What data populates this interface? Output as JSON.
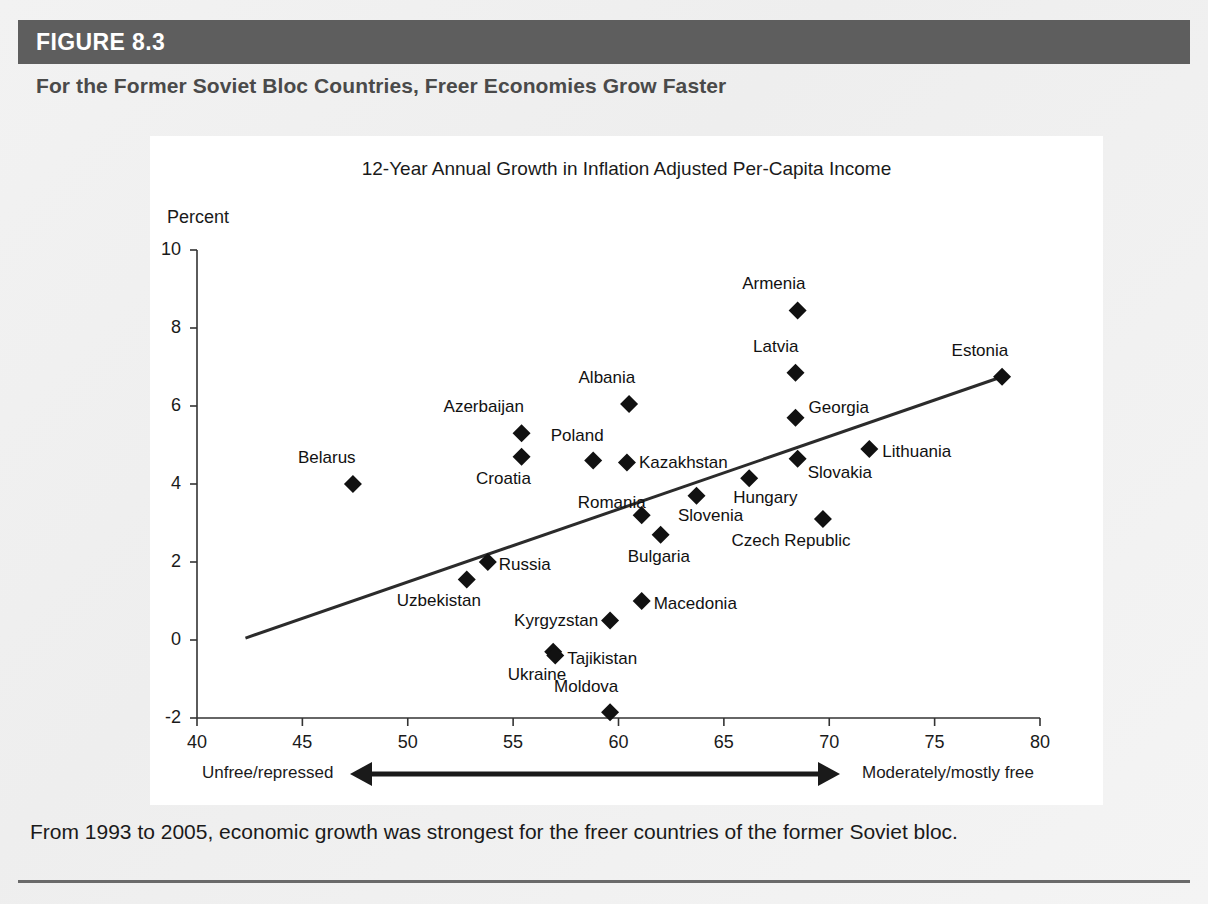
{
  "figure": {
    "number_label": "FIGURE 8.3",
    "title": "For the Former Soviet Bloc Countries, Freer Economies Grow Faster",
    "caption": "From 1993 to 2005, economic growth was strongest for the freer countries of the former Soviet bloc.",
    "bar_color": "#5e5e5e",
    "title_color": "#4a4a4a"
  },
  "chart_data": {
    "type": "scatter",
    "title": "12-Year Annual Growth in Inflation Adjusted Per-Capita Income",
    "xlabel": "",
    "ylabel": "Percent",
    "ylim": [
      -2,
      10
    ],
    "xlim": [
      40,
      80
    ],
    "xticks": [
      40,
      45,
      50,
      55,
      60,
      65,
      70,
      75,
      80
    ],
    "xtick_labels": [
      "40",
      "45",
      "50",
      "55",
      "60",
      "65",
      "70",
      "75",
      "80"
    ],
    "yticks": [
      -2,
      0,
      2,
      4,
      6,
      8,
      10
    ],
    "ytick_labels": [
      "-2",
      "0",
      "2",
      "4",
      "6",
      "8",
      "10"
    ],
    "grid": false,
    "legend": "none",
    "marker": "diamond",
    "marker_color": "#111111",
    "axis_direction": {
      "left_label": "Unfree/repressed",
      "right_label": "Moderately/mostly free",
      "arrow": "double"
    },
    "trendline": {
      "type": "linear",
      "x_start": 42.3,
      "y_start": 0.05,
      "x_end": 78.2,
      "y_end": 6.75,
      "color": "#2b2b2b"
    },
    "points": [
      {
        "name": "Armenia",
        "x": 68.5,
        "y": 8.45,
        "label_dx": -34,
        "label_dy": -26
      },
      {
        "name": "Latvia",
        "x": 68.4,
        "y": 6.85,
        "label_dx": -30,
        "label_dy": -26
      },
      {
        "name": "Estonia",
        "x": 78.2,
        "y": 6.75,
        "label_dx": -32,
        "label_dy": -26
      },
      {
        "name": "Albania",
        "x": 60.5,
        "y": 6.05,
        "label_dx": -32,
        "label_dy": -26
      },
      {
        "name": "Georgia",
        "x": 68.4,
        "y": 5.7,
        "label_dx": 13,
        "label_dy": -10
      },
      {
        "name": "Azerbaijan",
        "x": 55.4,
        "y": 5.3,
        "label_dx": -48,
        "label_dy": -26
      },
      {
        "name": "Lithuania",
        "x": 71.9,
        "y": 4.9,
        "label_dx": 13,
        "label_dy": 3
      },
      {
        "name": "Croatia",
        "x": 55.4,
        "y": 4.7,
        "label_dx": -36,
        "label_dy": 22
      },
      {
        "name": "Poland",
        "x": 58.8,
        "y": 4.6,
        "label_dx": -26,
        "label_dy": -25
      },
      {
        "name": "Slovakia",
        "x": 68.5,
        "y": 4.65,
        "label_dx": 10,
        "label_dy": 14
      },
      {
        "name": "Kazakhstan",
        "x": 60.4,
        "y": 4.55,
        "label_dx": 12,
        "label_dy": 0
      },
      {
        "name": "Hungary",
        "x": 66.2,
        "y": 4.15,
        "label_dx": -2,
        "label_dy": 20
      },
      {
        "name": "Belarus",
        "x": 47.4,
        "y": 4.0,
        "label_dx": -36,
        "label_dy": -26
      },
      {
        "name": "Slovenia",
        "x": 63.7,
        "y": 3.7,
        "label_dx": -4,
        "label_dy": 20
      },
      {
        "name": "Czech Republic",
        "x": 69.7,
        "y": 3.1,
        "label_dx": -50,
        "label_dy": 22
      },
      {
        "name": "Romania",
        "x": 61.1,
        "y": 3.2,
        "label_dx": -82,
        "label_dy": -12
      },
      {
        "name": "Bulgaria",
        "x": 62.0,
        "y": 2.7,
        "label_dx": -20,
        "label_dy": 22
      },
      {
        "name": "Russia",
        "x": 53.8,
        "y": 2.0,
        "label_dx": 11,
        "label_dy": 3
      },
      {
        "name": "Uzbekistan",
        "x": 52.8,
        "y": 1.55,
        "label_dx": -46,
        "label_dy": 21
      },
      {
        "name": "Macedonia",
        "x": 61.1,
        "y": 1.0,
        "label_dx": 12,
        "label_dy": 3
      },
      {
        "name": "Kyrgyzstan",
        "x": 59.6,
        "y": 0.5,
        "label_dx": -98,
        "label_dy": 0
      },
      {
        "name": "Ukraine",
        "x": 56.9,
        "y": -0.3,
        "label_dx": -34,
        "label_dy": 23
      },
      {
        "name": "Tajikistan",
        "x": 57.0,
        "y": -0.4,
        "label_dx": 12,
        "label_dy": 3
      },
      {
        "name": "Moldova",
        "x": 59.6,
        "y": -1.85,
        "label_dx": -34,
        "label_dy": -25
      }
    ]
  }
}
